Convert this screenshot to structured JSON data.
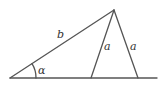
{
  "diagram": {
    "labels": {
      "side_b": "b",
      "side_a_inner": "a",
      "side_a_outer": "a",
      "angle": "α"
    },
    "colors": {
      "line": "#555555",
      "text": "#333333",
      "background": "#ffffff"
    }
  }
}
